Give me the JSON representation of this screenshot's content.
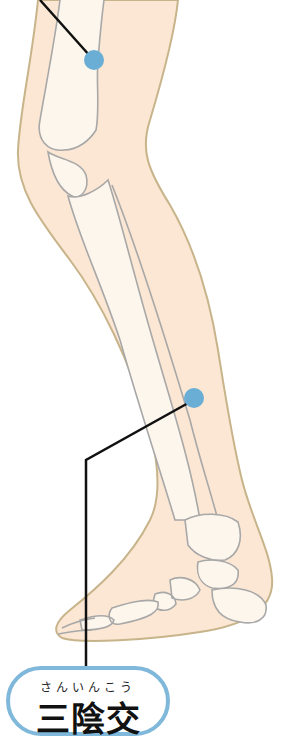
{
  "diagram": {
    "points": [
      {
        "id": "upper-point",
        "cx": 94,
        "cy": 60,
        "color": "#6aaed6"
      },
      {
        "id": "sanyinjiao-point",
        "cx": 194,
        "cy": 398,
        "color": "#6aaed6"
      }
    ],
    "colors": {
      "skin": "#fbe7d3",
      "skin_outline": "#c8b48a",
      "bone": "#fdf6ec",
      "bone_outline": "#a8a8a8",
      "leader_line": "#111111",
      "label_border": "#7fb8da"
    },
    "label": {
      "furigana": "さんいんこう",
      "kanji": "三陰交"
    }
  }
}
